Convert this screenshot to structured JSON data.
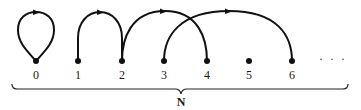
{
  "diagram": {
    "type": "function-graph",
    "nodes": [
      {
        "id": 0,
        "label": "0"
      },
      {
        "id": 1,
        "label": "1"
      },
      {
        "id": 2,
        "label": "2"
      },
      {
        "id": 3,
        "label": "3"
      },
      {
        "id": 4,
        "label": "4"
      },
      {
        "id": 5,
        "label": "5"
      },
      {
        "id": 6,
        "label": "6"
      }
    ],
    "edges": [
      {
        "from": 0,
        "to": 0,
        "kind": "loop"
      },
      {
        "from": 1,
        "to": 2,
        "kind": "arc"
      },
      {
        "from": 2,
        "to": 4,
        "kind": "arc"
      },
      {
        "from": 3,
        "to": 6,
        "kind": "arc"
      }
    ],
    "continuation": "· · ·",
    "brace_label": "N",
    "colors": {
      "stroke": "#111111",
      "background": "#ffffff"
    }
  }
}
